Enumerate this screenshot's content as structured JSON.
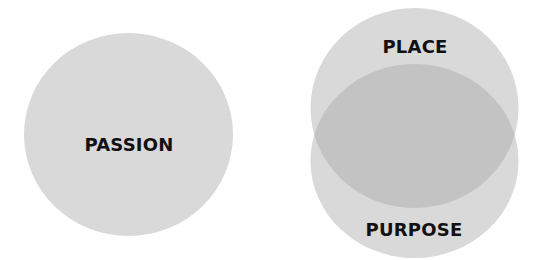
{
  "diagram": {
    "colors": {
      "circle_fill": "rgba(200,200,200,0.7)",
      "overlap_fill": "#c2c2c2",
      "label_color": "#111111",
      "background": "#ffffff"
    },
    "circles": [
      {
        "id": "passion",
        "label": "PASSION"
      },
      {
        "id": "place",
        "label": "PLACE"
      },
      {
        "id": "purpose",
        "label": "PURPOSE"
      }
    ]
  }
}
